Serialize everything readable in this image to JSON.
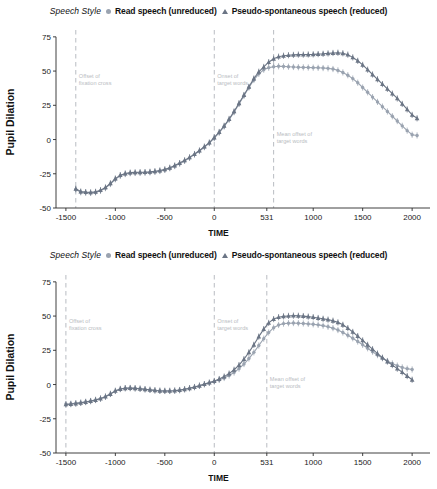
{
  "figure": {
    "panel_count": 2,
    "legend": {
      "title": "Speech Style",
      "entries": [
        {
          "label": "Read speech (unreduced)",
          "marker": "circle-marker",
          "color": "#9aa3b0"
        },
        {
          "label": "Pseudo-spontaneous speech (reduced)",
          "marker": "triangle-marker",
          "color": "#6b7585"
        }
      ]
    }
  },
  "chart_data": [
    {
      "type": "line",
      "panel": "top",
      "title": "",
      "xlabel": "TIME",
      "ylabel": "Pupil Dilation",
      "xlim": [
        -1600,
        2120
      ],
      "ylim": [
        -50,
        80
      ],
      "xticks": [
        -1500,
        -1000,
        -500,
        0,
        531,
        1000,
        1500,
        2000
      ],
      "xticklabels": [
        "-1500",
        "-1000",
        "-500",
        "0",
        "531",
        "1000",
        "1500",
        "2000"
      ],
      "yticks": [
        -50,
        -25,
        0,
        25,
        50,
        75
      ],
      "yticklabels": [
        "-50",
        "-25",
        "0",
        "25",
        "50",
        "75"
      ],
      "grid": false,
      "legend_position": "top-center",
      "vlines": [
        {
          "x": -1400,
          "label": [
            "Offset of",
            "fixation cross"
          ],
          "color": "#b9bcc2"
        },
        {
          "x": 0,
          "label": [
            "Onset of",
            "target words"
          ],
          "color": "#b9bcc2"
        },
        {
          "x": 600,
          "label": [
            "Mean offset of",
            "target words"
          ],
          "color": "#b9bcc2"
        }
      ],
      "x": [
        -1400,
        -1350,
        -1300,
        -1250,
        -1200,
        -1150,
        -1100,
        -1050,
        -1000,
        -950,
        -900,
        -850,
        -800,
        -750,
        -700,
        -650,
        -600,
        -550,
        -500,
        -450,
        -400,
        -350,
        -300,
        -250,
        -200,
        -150,
        -100,
        -50,
        0,
        50,
        100,
        150,
        200,
        250,
        300,
        350,
        400,
        450,
        500,
        550,
        600,
        650,
        700,
        750,
        800,
        850,
        900,
        950,
        1000,
        1050,
        1100,
        1150,
        1200,
        1250,
        1300,
        1350,
        1400,
        1450,
        1500,
        1550,
        1600,
        1650,
        1700,
        1750,
        1800,
        1850,
        1900,
        1950,
        2000,
        2050
      ],
      "series": [
        {
          "name": "Read speech (unreduced)",
          "marker": "circle",
          "color": "#9aa3b0",
          "values": [
            -36.5,
            -38.5,
            -38.8,
            -39.0,
            -38.6,
            -37.4,
            -35.5,
            -32.5,
            -29.0,
            -26.5,
            -25.2,
            -24.6,
            -24.4,
            -24.3,
            -24.2,
            -24.0,
            -23.6,
            -23.0,
            -22.2,
            -21.0,
            -19.4,
            -17.6,
            -15.6,
            -13.4,
            -11.0,
            -8.4,
            -5.6,
            -2.6,
            1.0,
            5.0,
            9.5,
            14.5,
            20.0,
            26.0,
            32.0,
            38.0,
            43.5,
            48.0,
            51.0,
            52.5,
            53.2,
            53.5,
            53.4,
            53.2,
            53.0,
            52.8,
            52.7,
            52.6,
            52.5,
            52.4,
            52.2,
            52.0,
            51.5,
            50.5,
            49.0,
            47.0,
            44.5,
            41.5,
            38.0,
            34.5,
            31.0,
            27.5,
            24.0,
            20.5,
            17.0,
            13.5,
            10.0,
            6.5,
            3.5,
            3.0
          ]
        },
        {
          "name": "Pseudo-spontaneous speech (reduced)",
          "marker": "triangle",
          "color": "#6b7585",
          "values": [
            -36.0,
            -38.0,
            -38.4,
            -38.6,
            -38.2,
            -37.0,
            -35.0,
            -32.0,
            -28.5,
            -26.0,
            -24.8,
            -24.2,
            -24.0,
            -23.9,
            -23.8,
            -23.6,
            -23.2,
            -22.6,
            -21.8,
            -20.6,
            -19.0,
            -17.2,
            -15.2,
            -13.0,
            -10.6,
            -8.0,
            -5.2,
            -2.2,
            1.5,
            5.5,
            10.0,
            15.0,
            20.5,
            26.5,
            32.5,
            38.5,
            44.5,
            49.5,
            53.0,
            56.5,
            59.0,
            60.5,
            61.2,
            61.6,
            61.8,
            62.0,
            62.0,
            62.1,
            62.2,
            62.4,
            62.6,
            62.9,
            63.2,
            63.4,
            63.0,
            62.0,
            60.0,
            57.5,
            54.5,
            51.0,
            47.5,
            44.0,
            40.5,
            37.0,
            33.5,
            30.0,
            26.0,
            22.0,
            18.0,
            15.5
          ]
        }
      ]
    },
    {
      "type": "line",
      "panel": "bottom",
      "title": "",
      "xlabel": "TIME",
      "ylabel": "Pupil Dilation",
      "xlim": [
        -1600,
        2120
      ],
      "ylim": [
        -50,
        80
      ],
      "xticks": [
        -1500,
        -1000,
        -500,
        0,
        531,
        1000,
        1500,
        2000
      ],
      "xticklabels": [
        "-1500",
        "-1000",
        "-500",
        "0",
        "531",
        "1000",
        "1500",
        "2000"
      ],
      "yticks": [
        -50,
        -25,
        0,
        25,
        50,
        75
      ],
      "yticklabels": [
        "-50",
        "-25",
        "0",
        "25",
        "50",
        "75"
      ],
      "grid": false,
      "legend_position": "top-center",
      "vlines": [
        {
          "x": -1500,
          "label": [
            "Offset of",
            "fixation cross"
          ],
          "color": "#b9bcc2"
        },
        {
          "x": 0,
          "label": [
            "Onset of",
            "target words"
          ],
          "color": "#b9bcc2"
        },
        {
          "x": 531,
          "label": [
            "Mean offset of",
            "target words"
          ],
          "color": "#b9bcc2"
        }
      ],
      "x": [
        -1500,
        -1450,
        -1400,
        -1350,
        -1300,
        -1250,
        -1200,
        -1150,
        -1100,
        -1050,
        -1000,
        -950,
        -900,
        -850,
        -800,
        -750,
        -700,
        -650,
        -600,
        -550,
        -500,
        -450,
        -400,
        -350,
        -300,
        -250,
        -200,
        -150,
        -100,
        -50,
        0,
        50,
        100,
        150,
        200,
        250,
        300,
        350,
        400,
        450,
        500,
        550,
        600,
        650,
        700,
        750,
        800,
        850,
        900,
        950,
        1000,
        1050,
        1100,
        1150,
        1200,
        1250,
        1300,
        1350,
        1400,
        1450,
        1500,
        1550,
        1600,
        1650,
        1700,
        1750,
        1800,
        1850,
        1900,
        1950,
        2000
      ],
      "series": [
        {
          "name": "Read speech (unreduced)",
          "marker": "circle",
          "color": "#9aa3b0",
          "values": [
            -14.2,
            -14.0,
            -13.6,
            -13.2,
            -12.6,
            -12.0,
            -11.2,
            -10.2,
            -8.8,
            -6.8,
            -4.6,
            -3.2,
            -2.6,
            -2.5,
            -2.7,
            -3.0,
            -3.4,
            -3.8,
            -4.2,
            -4.5,
            -4.6,
            -4.6,
            -4.4,
            -4.0,
            -3.4,
            -2.6,
            -1.8,
            -0.8,
            0.2,
            1.2,
            2.2,
            3.4,
            4.8,
            6.6,
            8.8,
            11.6,
            15.0,
            19.0,
            23.5,
            28.5,
            33.5,
            38.0,
            41.5,
            43.5,
            44.5,
            44.8,
            44.9,
            44.8,
            44.6,
            44.3,
            44.0,
            43.6,
            43.0,
            42.2,
            41.2,
            39.8,
            38.0,
            36.0,
            33.8,
            31.4,
            29.0,
            26.5,
            24.0,
            21.5,
            19.2,
            17.2,
            15.4,
            13.8,
            12.5,
            11.6,
            11.0
          ]
        },
        {
          "name": "Pseudo-spontaneous speech (reduced)",
          "marker": "triangle",
          "color": "#6b7585",
          "values": [
            -14.5,
            -14.3,
            -13.9,
            -13.4,
            -12.8,
            -12.1,
            -11.3,
            -10.3,
            -8.9,
            -6.9,
            -4.7,
            -3.3,
            -2.7,
            -2.6,
            -2.8,
            -3.1,
            -3.5,
            -3.9,
            -4.3,
            -4.6,
            -4.7,
            -4.7,
            -4.5,
            -4.1,
            -3.5,
            -2.7,
            -1.9,
            -0.9,
            0.3,
            1.4,
            2.6,
            4.0,
            5.8,
            8.0,
            10.8,
            14.2,
            18.5,
            23.5,
            29.0,
            35.0,
            40.5,
            45.0,
            47.8,
            49.2,
            49.8,
            50.1,
            50.3,
            50.2,
            50.0,
            49.6,
            49.2,
            48.6,
            48.0,
            47.4,
            46.6,
            45.4,
            43.6,
            41.2,
            38.4,
            35.4,
            32.2,
            29.0,
            25.8,
            22.6,
            19.6,
            16.8,
            14.2,
            11.6,
            9.0,
            6.2,
            3.5
          ]
        }
      ]
    }
  ]
}
